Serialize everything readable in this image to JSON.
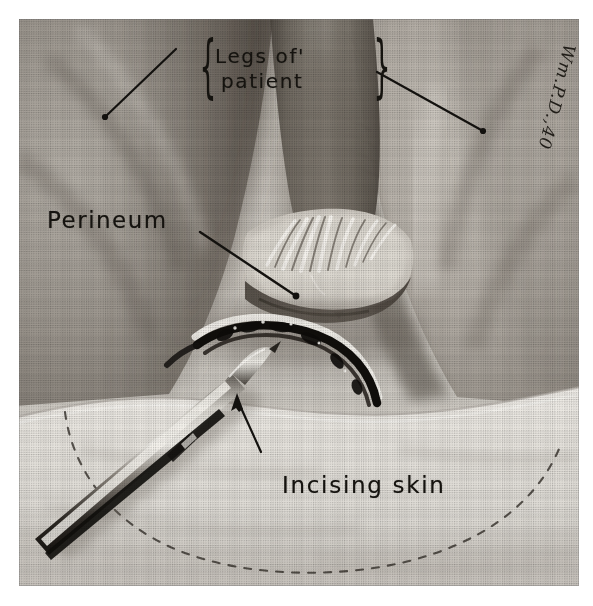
{
  "plate": {
    "kind": "halftone-medical-illustration",
    "subject": "perineal surgical field, legs abducted, scalpel incising skin",
    "medium": "pencil / wash drawing reproduced as halftone print",
    "palette": {
      "paper": "#efedea",
      "midtone_skin": "#a9a49d",
      "shadow": "#6d6760",
      "deep_shadow": "#3d3832",
      "highlight": "#f2efe9",
      "ink": "#15130f",
      "drape": "#e3e0da"
    },
    "elements": [
      "left thigh (upper-left mass, dark shaded)",
      "right thigh (upper-right mass, lighter)",
      "gluteal cleft / natal fold at center",
      "perineal tissue with radiating folds",
      "curved dark incision line below perineum",
      "surgical drape / towel across lower third",
      "dashed pencil guide line marking planned incision",
      "scalpel held from lower-left, blade at incision"
    ]
  },
  "annotations": {
    "legs_line1": "Legs of'",
    "legs_line2": "patient",
    "brace_open": "{",
    "brace_close": "}",
    "perineum": "Perineum",
    "incising": "Incising skin",
    "signature": "Wm.P.D.,40"
  },
  "leaders": {
    "legs_left": {
      "from": [
        176,
        49
      ],
      "to": [
        105,
        117
      ],
      "style": "line-with-dot"
    },
    "legs_right": {
      "from": [
        377,
        72
      ],
      "to": [
        483,
        131
      ],
      "style": "line-with-dot"
    },
    "perineum": {
      "from": [
        200,
        232
      ],
      "to": [
        296,
        296
      ],
      "style": "line-with-dot"
    },
    "incising": {
      "from": [
        261,
        452
      ],
      "to": [
        236,
        394
      ],
      "style": "arrow"
    }
  }
}
